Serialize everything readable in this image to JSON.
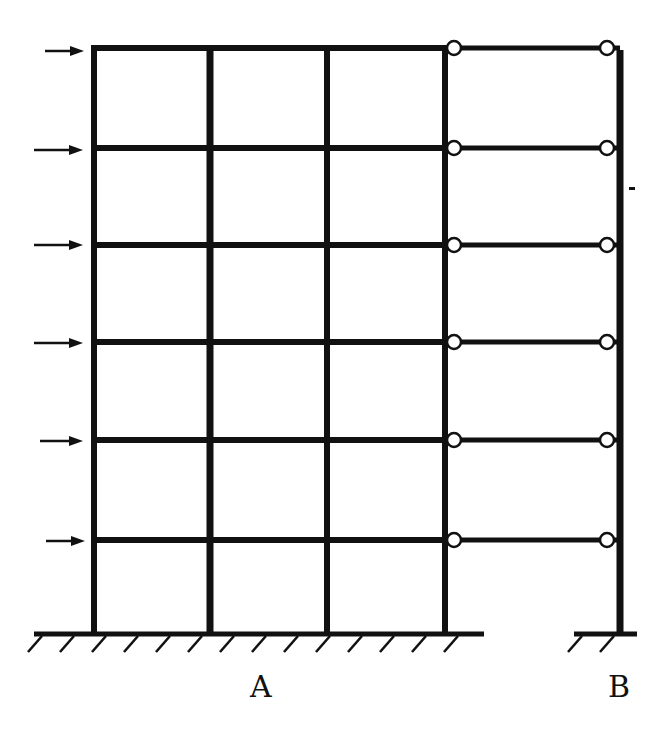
{
  "diagram": {
    "type": "structural-frame",
    "colors": {
      "line": "#111111",
      "background": "#ffffff",
      "hinge_fill": "#ffffff"
    },
    "frame_a": {
      "label": "A",
      "columns_x": [
        94,
        210,
        327,
        445
      ],
      "bays": 3
    },
    "column_b": {
      "label": "B",
      "x": 620
    },
    "floors": [
      {
        "level": 6,
        "y": 48
      },
      {
        "level": 5,
        "y": 148
      },
      {
        "level": 4,
        "y": 245
      },
      {
        "level": 3,
        "y": 342
      },
      {
        "level": 2,
        "y": 440
      },
      {
        "level": 1,
        "y": 540
      }
    ],
    "ground_y": 634,
    "hinges": {
      "left_x": 454,
      "right_x": 607,
      "radius": 7
    },
    "loads": [
      {
        "floor": 6,
        "from_x": 45,
        "to_x": 84,
        "y": 51
      },
      {
        "floor": 5,
        "from_x": 34,
        "to_x": 83,
        "y": 150
      },
      {
        "floor": 4,
        "from_x": 34,
        "to_x": 83,
        "y": 245
      },
      {
        "floor": 3,
        "from_x": 34,
        "to_x": 83,
        "y": 343
      },
      {
        "floor": 2,
        "from_x": 40,
        "to_x": 83,
        "y": 441
      },
      {
        "floor": 1,
        "from_x": 46,
        "to_x": 85,
        "y": 541
      }
    ],
    "supports": [
      {
        "name": "ground-a",
        "x1": 34,
        "x2": 484
      },
      {
        "name": "ground-b",
        "x1": 574,
        "x2": 637
      }
    ],
    "labels": [
      {
        "text": "A",
        "x": 250,
        "y": 672
      },
      {
        "text": "B",
        "x": 608,
        "y": 672
      }
    ]
  }
}
